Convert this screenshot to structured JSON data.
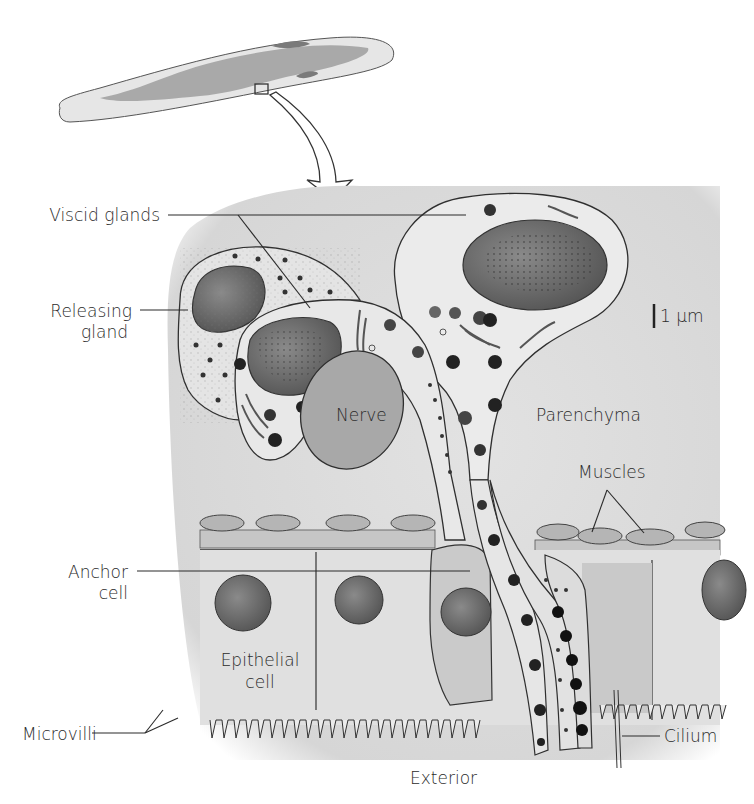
{
  "diagram": {
    "labels": {
      "viscid_glands": "Viscid glands",
      "releasing_gland_line1": "Releasing",
      "releasing_gland_line2": "gland",
      "scale_bar": "1 µm",
      "nerve": "Nerve",
      "parenchyma": "Parenchyma",
      "muscles": "Muscles",
      "anchor_cell_line1": "Anchor",
      "anchor_cell_line2": "cell",
      "epithelial_cell_line1": "Epithelial",
      "epithelial_cell_line2": "cell",
      "microvilli": "Microvilli",
      "cilium": "Cilium",
      "exterior": "Exterior"
    },
    "colors": {
      "tissue_bg": "#dcdcdc",
      "cell_fill": "#e9e9e9",
      "nucleus": "#6e6e6e",
      "nerve": "#a9a9a9",
      "outline": "#2f2f2f",
      "granule": "#222222",
      "muscle": "#b5b5b5"
    }
  }
}
